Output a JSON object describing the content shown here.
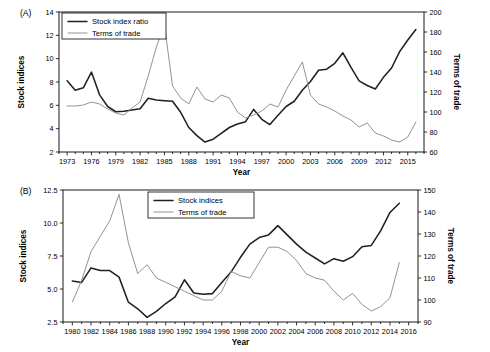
{
  "figure": {
    "panels": [
      {
        "tag": "(A)",
        "xlabel": "Year",
        "ylabel_left": "Stock indices",
        "ylabel_right": "Terms of trade"
      },
      {
        "tag": "(B)",
        "xlabel": "Year",
        "ylabel_left": "Stock indices",
        "ylabel_right": "Terms of trade"
      }
    ]
  },
  "chart_data": [
    {
      "type": "line",
      "title": "",
      "panel": "(A)",
      "xlabel": "Year",
      "ylabel": "Stock indices",
      "ylabel_secondary": "Terms of trade",
      "xlim": [
        1972,
        2017
      ],
      "ylim": [
        2,
        14
      ],
      "ylim_secondary": [
        60,
        200
      ],
      "yticks": [
        2,
        4,
        6,
        8,
        10,
        12,
        14
      ],
      "yticks_secondary": [
        60,
        80,
        100,
        120,
        140,
        160,
        180,
        200
      ],
      "xticks": [
        1973,
        1976,
        1979,
        1982,
        1985,
        1988,
        1991,
        1994,
        1997,
        2000,
        2003,
        2006,
        2009,
        2012,
        2015
      ],
      "xtick_minor_step": 1,
      "grid": false,
      "legend_position": "top-left",
      "x": [
        1973,
        1974,
        1975,
        1976,
        1977,
        1978,
        1979,
        1980,
        1981,
        1982,
        1983,
        1984,
        1985,
        1986,
        1987,
        1988,
        1989,
        1990,
        1991,
        1992,
        1993,
        1994,
        1995,
        1996,
        1997,
        1998,
        1999,
        2000,
        2001,
        2002,
        2003,
        2004,
        2005,
        2006,
        2007,
        2008,
        2009,
        2010,
        2011,
        2012,
        2013,
        2014,
        2015,
        2016
      ],
      "series": [
        {
          "name": "Stock index ratio",
          "axis": "left",
          "color": "#231f20",
          "style": "thick",
          "values": [
            8.1,
            7.3,
            7.5,
            8.85,
            6.9,
            5.9,
            5.45,
            5.5,
            5.6,
            5.7,
            6.6,
            6.45,
            6.4,
            6.35,
            5.4,
            4.1,
            3.4,
            2.85,
            3.1,
            3.6,
            4.1,
            4.4,
            4.6,
            5.65,
            4.8,
            4.35,
            5.15,
            5.9,
            6.35,
            7.3,
            8.05,
            9.0,
            9.1,
            9.6,
            10.5,
            9.25,
            8.1,
            7.7,
            7.4,
            8.4,
            9.2,
            10.6,
            11.6,
            12.5
          ]
        },
        {
          "name": "Terms of trade",
          "axis": "right",
          "color": "#8c8c8c",
          "style": "thin",
          "values": [
            106,
            106,
            107,
            110,
            108,
            103,
            99,
            97,
            104,
            110,
            136,
            165,
            187,
            126,
            114,
            108,
            125,
            113,
            110,
            117,
            114,
            100,
            94,
            97,
            101,
            108,
            105,
            122,
            136,
            150,
            117,
            108,
            105,
            101,
            96,
            92,
            85,
            89,
            79,
            76,
            72,
            70,
            75,
            90
          ]
        }
      ]
    },
    {
      "type": "line",
      "title": "",
      "panel": "(B)",
      "xlabel": "Year",
      "ylabel": "Stock indices",
      "ylabel_secondary": "Terms of trade",
      "xlim": [
        1979,
        2017
      ],
      "ylim": [
        2.5,
        12.5
      ],
      "ylim_secondary": [
        90,
        150
      ],
      "yticks": [
        2.5,
        5.0,
        7.5,
        10.0,
        12.5
      ],
      "yticks_secondary": [
        90,
        100,
        110,
        120,
        130,
        140,
        150
      ],
      "xticks": [
        1980,
        1982,
        1984,
        1986,
        1988,
        1990,
        1992,
        1994,
        1996,
        1998,
        2000,
        2002,
        2004,
        2006,
        2008,
        2010,
        2012,
        2014,
        2016
      ],
      "xtick_minor_step": 1,
      "grid": false,
      "legend_position": "top-right",
      "x": [
        1980,
        1981,
        1982,
        1983,
        1984,
        1985,
        1986,
        1987,
        1988,
        1989,
        1990,
        1991,
        1992,
        1993,
        1994,
        1995,
        1996,
        1997,
        1998,
        1999,
        2000,
        2001,
        2002,
        2003,
        2004,
        2005,
        2006,
        2007,
        2008,
        2009,
        2010,
        2011,
        2012,
        2013,
        2014,
        2015
      ],
      "series": [
        {
          "name": "Stock indices",
          "axis": "left",
          "color": "#231f20",
          "style": "thick",
          "values": [
            5.6,
            5.5,
            6.6,
            6.4,
            6.4,
            5.9,
            4.0,
            3.5,
            2.85,
            3.3,
            3.9,
            4.4,
            5.7,
            4.7,
            4.6,
            4.65,
            5.5,
            6.3,
            7.4,
            8.4,
            8.9,
            9.1,
            9.8,
            9.1,
            8.4,
            7.8,
            7.35,
            6.9,
            7.3,
            7.1,
            7.45,
            8.2,
            8.3,
            9.4,
            10.8,
            11.5
          ]
        },
        {
          "name": "Terms of trade",
          "axis": "right",
          "color": "#8c8c8c",
          "style": "thin",
          "values": [
            99,
            109,
            122,
            129,
            136,
            148,
            126,
            112,
            116,
            110,
            108,
            106,
            104,
            102,
            100,
            100,
            104,
            113,
            111,
            110,
            117,
            124,
            124,
            122,
            118,
            112,
            110,
            109,
            104,
            100,
            103,
            98,
            95,
            97,
            101,
            117
          ]
        }
      ]
    }
  ],
  "legends": [
    {
      "items": [
        {
          "label": "Stock index ratio",
          "style": "thick"
        },
        {
          "label": "Terms of trade",
          "style": "thin"
        }
      ]
    },
    {
      "items": [
        {
          "label": "Stock indices",
          "style": "thick"
        },
        {
          "label": "Terms of trade",
          "style": "thin"
        }
      ]
    }
  ]
}
